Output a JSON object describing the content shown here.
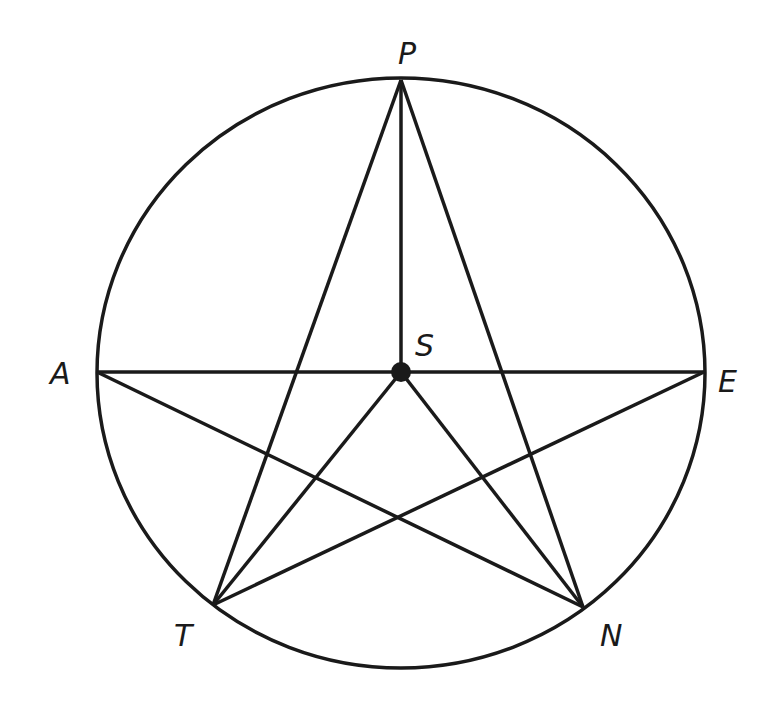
{
  "diagram": {
    "type": "geometry",
    "stroke_color": "#1a1a1a",
    "background": "#ffffff",
    "circle": {
      "cx": 401,
      "cy": 373,
      "rx": 304,
      "ry": 295
    },
    "points": {
      "P": {
        "label": "P",
        "x": 401,
        "y": 80
      },
      "A": {
        "label": "A",
        "x": 97,
        "y": 372
      },
      "E": {
        "label": "E",
        "x": 704,
        "y": 372
      },
      "T": {
        "label": "T",
        "x": 213,
        "y": 605
      },
      "N": {
        "label": "N",
        "x": 583,
        "y": 607
      },
      "S": {
        "label": "S",
        "x": 401,
        "y": 372
      }
    },
    "labels": {
      "P": "P",
      "A": "A",
      "E": "E",
      "T": "T",
      "N": "N",
      "S": "S"
    },
    "segments": [
      [
        "P",
        "T"
      ],
      [
        "P",
        "N"
      ],
      [
        "A",
        "E"
      ],
      [
        "A",
        "N"
      ],
      [
        "E",
        "T"
      ],
      [
        "P",
        "S"
      ],
      [
        "S",
        "T"
      ],
      [
        "S",
        "N"
      ]
    ]
  }
}
